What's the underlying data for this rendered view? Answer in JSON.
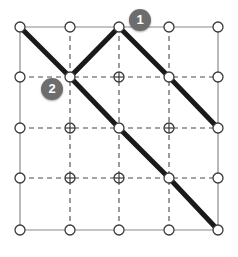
{
  "figure": {
    "background_color": "#ffffff",
    "width": 238,
    "height": 257
  },
  "grid": {
    "columns": 5,
    "rows": 5,
    "x_positions": [
      20,
      70,
      119,
      169,
      218
    ],
    "y_positions": [
      27,
      77,
      128,
      178,
      230
    ],
    "border_color": "#8a8a8a",
    "border_width": 1.2,
    "interior_line_color": "#4a4a4a",
    "interior_line_width": 1.1,
    "interior_line_style": "dashed",
    "dash_pattern": "5,4"
  },
  "nodes": {
    "radius": 5,
    "stroke_color": "#3a3a3a",
    "stroke_width": 1.3,
    "fill_color": "#ffffff",
    "interior_marker": "cross-in-circle",
    "edge_marker": "circle"
  },
  "path": {
    "color": "#1a1a1a",
    "width": 5,
    "linecap": "round",
    "linejoin": "round",
    "segments": [
      {
        "name": "zigzag-then-descent",
        "points": [
          [
            20,
            27
          ],
          [
            70,
            77
          ],
          [
            119,
            27
          ],
          [
            169,
            77
          ],
          [
            218,
            128
          ]
        ]
      },
      {
        "name": "main-diagonal",
        "points": [
          [
            70,
            77
          ],
          [
            119,
            128
          ],
          [
            169,
            178
          ],
          [
            218,
            230
          ]
        ]
      }
    ]
  },
  "markers": [
    {
      "id": "marker-1",
      "label": "1",
      "x": 140,
      "y": 20,
      "color": "#6d6d6d",
      "text_color": "#ffffff"
    },
    {
      "id": "marker-2",
      "label": "2",
      "x": 52,
      "y": 89,
      "color": "#6d6d6d",
      "text_color": "#ffffff"
    }
  ]
}
